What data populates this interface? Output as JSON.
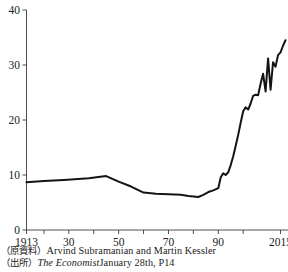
{
  "chart_data": {
    "type": "line",
    "title": "",
    "subtitle": "",
    "xlabel": "",
    "ylabel": "",
    "xlim": [
      1913,
      2018
    ],
    "ylim": [
      0,
      40
    ],
    "grid": false,
    "legend": null,
    "y_ticks": [
      0,
      10,
      20,
      30,
      40
    ],
    "y_tick_labels": [
      "0",
      "10",
      "20",
      "30",
      "40"
    ],
    "x_ticks": [
      1913,
      1920,
      1930,
      1940,
      1950,
      1960,
      1970,
      1980,
      1990,
      2000,
      2015
    ],
    "x_tick_labels": [
      "1913",
      "",
      "30",
      "",
      "50",
      "",
      "70",
      "",
      "90",
      "",
      "2015"
    ],
    "series": [
      {
        "name": "value",
        "color": "#141414",
        "x": [
          1913,
          1920,
          1928,
          1938,
          1945,
          1950,
          1955,
          1960,
          1965,
          1970,
          1975,
          1978,
          1982,
          1984,
          1986,
          1988,
          1990,
          1991,
          1992,
          1993,
          1994,
          1995,
          1996,
          1997,
          1998,
          1999,
          2000,
          2001,
          2002,
          2003,
          2004,
          2005,
          2006,
          2007,
          2008,
          2009,
          2010,
          2011,
          2012,
          2013,
          2014,
          2015,
          2016,
          2017
        ],
        "y": [
          8.7,
          8.9,
          9.1,
          9.4,
          9.8,
          8.8,
          7.9,
          6.8,
          6.6,
          6.5,
          6.4,
          6.2,
          6.0,
          6.4,
          6.9,
          7.2,
          7.6,
          9.6,
          10.3,
          10.0,
          10.5,
          11.8,
          13.4,
          15.3,
          17.3,
          19.5,
          21.6,
          22.3,
          21.9,
          23.0,
          24.4,
          24.6,
          24.5,
          26.6,
          28.4,
          25.2,
          31.2,
          25.5,
          30.5,
          29.7,
          31.8,
          32.3,
          33.5,
          34.5
        ]
      }
    ]
  },
  "source": {
    "line1_prefix": "（原資料）",
    "line1_text": "Arvind Subramanian and Martin Kessler",
    "line2_prefix": "（出所）",
    "line2_italic": "The Economist",
    "line2_text": "January 28th, P14"
  }
}
